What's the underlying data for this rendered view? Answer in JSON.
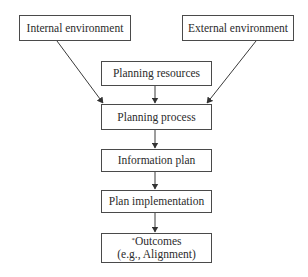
{
  "diagram": {
    "type": "flowchart",
    "colors": {
      "border": "#4a4a4a",
      "text": "#2b2b2b",
      "background": "#ffffff"
    },
    "nodes": {
      "internal_environment": {
        "label": "Internal environment"
      },
      "external_environment": {
        "label": "External environment"
      },
      "planning_resources": {
        "label": "Planning resources"
      },
      "planning_process": {
        "label": "Planning process"
      },
      "information_plan": {
        "label": "Information plan"
      },
      "plan_implementation": {
        "label": "Plan implementation"
      },
      "outcomes": {
        "marker": "*",
        "line1": "Outcomes",
        "line2": "(e.g., Alignment)"
      }
    },
    "edges": [
      {
        "from": "Internal environment",
        "to": "Planning process"
      },
      {
        "from": "External environment",
        "to": "Planning process"
      },
      {
        "from": "Planning resources",
        "to": "Planning process"
      },
      {
        "from": "Planning process",
        "to": "Information plan"
      },
      {
        "from": "Information plan",
        "to": "Plan implementation"
      },
      {
        "from": "Plan implementation",
        "to": "Outcomes (e.g., Alignment)"
      }
    ]
  }
}
